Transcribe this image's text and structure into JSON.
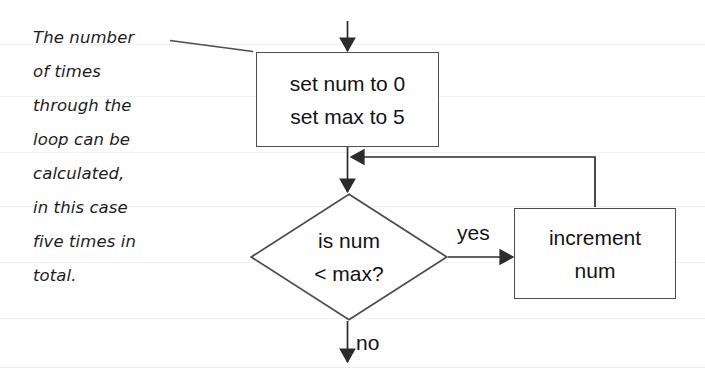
{
  "diagram": {
    "annotation": {
      "lines": [
        "The number",
        "of times",
        "through the",
        "loop can be",
        "calculated,",
        "in this case",
        "five times in",
        "total."
      ]
    },
    "nodes": {
      "process": {
        "type": "process",
        "line1": "set num to 0",
        "line2": "set max to 5"
      },
      "decision": {
        "type": "decision",
        "line1": "is num",
        "line2": "< max?"
      },
      "increment": {
        "type": "process",
        "line1": "increment",
        "line2": "num"
      }
    },
    "edges": {
      "yes_label": "yes",
      "no_label": "no"
    },
    "colors": {
      "stroke": "#4d4d4d",
      "arrow": "#2b2b2b",
      "text": "#131313",
      "background": "#ffffff"
    }
  }
}
